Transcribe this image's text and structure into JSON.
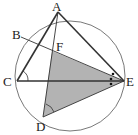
{
  "diagram": {
    "type": "geometry",
    "labels": {
      "A": "A",
      "B": "B",
      "C": "C",
      "D": "D",
      "E": "E",
      "F": "F"
    },
    "colors": {
      "stroke": "#333333",
      "fill": "#b3b3b3",
      "circle": "#555555"
    }
  }
}
